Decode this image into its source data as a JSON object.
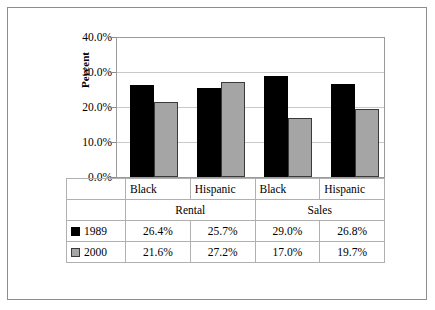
{
  "chart_data": {
    "type": "bar",
    "title": "",
    "xlabel": "",
    "ylabel": "Percent",
    "ylim": [
      0,
      40
    ],
    "ytick_labels": [
      "40.0%",
      "30.0%",
      "20.0%",
      "10.0%",
      "0.0%"
    ],
    "ytick_values": [
      40,
      30,
      20,
      10,
      0
    ],
    "grid": true,
    "legend_position": "data-table",
    "categories": [
      "Black",
      "Hispanic",
      "Black",
      "Hispanic"
    ],
    "group_labels": [
      "Rental",
      "Sales"
    ],
    "series": [
      {
        "name": "1989",
        "color": "#000000",
        "values": [
          26.4,
          25.7,
          29.0,
          26.8
        ],
        "value_labels": [
          "26.4%",
          "25.7%",
          "29.0%",
          "26.8%"
        ]
      },
      {
        "name": "2000",
        "color": "#a5a5a5",
        "values": [
          21.6,
          27.2,
          17.0,
          19.7
        ],
        "value_labels": [
          "21.6%",
          "27.2%",
          "17.0%",
          "19.7%"
        ]
      }
    ]
  },
  "axis": {
    "y_title": "Percent",
    "ticks": [
      "40.0%",
      "30.0%",
      "20.0%",
      "10.0%",
      "0.0%"
    ]
  },
  "table": {
    "categories": [
      "Black",
      "Hispanic",
      "Black",
      "Hispanic"
    ],
    "groups": [
      "Rental",
      "Sales"
    ],
    "rows": [
      {
        "label": "1989",
        "swatch": "black-square-icon",
        "values": [
          "26.4%",
          "25.7%",
          "29.0%",
          "26.8%"
        ]
      },
      {
        "label": "2000",
        "swatch": "gray-square-icon",
        "values": [
          "21.6%",
          "27.2%",
          "17.0%",
          "19.7%"
        ]
      }
    ]
  }
}
